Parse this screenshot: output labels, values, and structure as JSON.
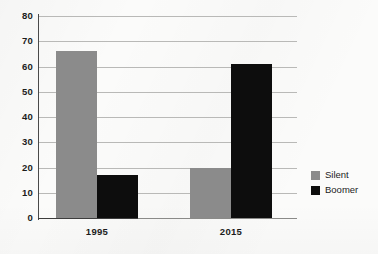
{
  "chart_data": {
    "type": "bar",
    "title": "",
    "subtitle": "",
    "xlabel": "",
    "ylabel": "",
    "categories": [
      "1995",
      "2015"
    ],
    "series": [
      {
        "name": "Silent",
        "color": "#8b8b8b",
        "values": [
          66,
          20
        ]
      },
      {
        "name": "Boomer",
        "color": "#0d0d0d",
        "values": [
          17,
          61
        ]
      }
    ],
    "ylim": [
      0,
      80
    ],
    "ytick_labels": [
      "0",
      "10",
      "20",
      "30",
      "40",
      "50",
      "60",
      "70",
      "80"
    ],
    "ytick_values": [
      0,
      10,
      20,
      30,
      40,
      50,
      60,
      70,
      80
    ],
    "grid": true,
    "grid_axis": "y",
    "legend_position": "right",
    "legend": [
      {
        "label": "Silent",
        "color": "#8b8b8b"
      },
      {
        "label": "Boomer",
        "color": "#0d0d0d"
      }
    ]
  },
  "colors": {
    "silent": "#8b8b8b",
    "boomer": "#0d0d0d",
    "grid": "#b9b9b7",
    "axis": "#4a4a4a",
    "text": "#1c1c1c",
    "background": "#fbfbfa"
  }
}
